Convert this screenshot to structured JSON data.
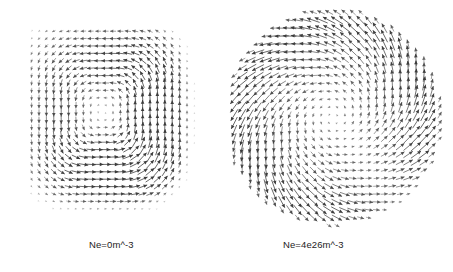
{
  "figure": {
    "background_color": "#ffffff",
    "arrow_color": "#3a3a3a",
    "width": 453,
    "height": 272
  },
  "panels": [
    {
      "id": "panel-left",
      "caption": "Ne=0m^-3",
      "field_type": "closed-recirculation-rounded-square",
      "center_x": 97,
      "center_y": 112
    },
    {
      "id": "panel-right",
      "caption": "Ne=4e26m^-3",
      "field_type": "spiral-vortex",
      "center_x": 338,
      "center_y": 116
    }
  ],
  "chart_data": {
    "type": "scatter",
    "subtype": "quiver",
    "title": "",
    "xlabel": "",
    "ylabel": "",
    "grid": false,
    "legend_position": "none",
    "annotations": [
      "Ne=0m^-3",
      "Ne=4e26m^-3"
    ],
    "series": [
      {
        "name": "Ne=0m^-3",
        "panel": "left",
        "description": "Vector field forming a single closed recirculating cell with rounded-square streamlines; flow circulates clockwise around an off-centre stagnation point located slightly left of and above the panel centre. Arrow magnitude is largest along the right-hand and lower-right boundary of the cell and decays to near zero at the vortex core and outside the cell boundary.",
        "grid_nx": 23,
        "grid_ny": 25,
        "grid_spacing_px": 7.4,
        "domain_shape": "rounded-square",
        "domain_radius_px": 84,
        "core": {
          "x": -10,
          "y": -8
        },
        "rotation": "clockwise",
        "max_arrow_length_px": 9.5,
        "min_arrow_length_px": 0.4,
        "superellipse_exponent": 3.2,
        "strength": 1.0,
        "asymmetry_x": 0.32,
        "asymmetry_y": 0.18
      },
      {
        "name": "Ne=4e26m^-3",
        "panel": "right",
        "description": "Vector field forming a spiral (swirling) pattern on a circular domain; arrows rotate clockwise while also tilting outward, producing pinwheel-like spiral arms. Arrow magnitude grows with radius, reaching a maximum near the outer edge, with a quiet low-magnitude core at the centre and a visible spiral shear seam running from the centre toward the lower-right.",
        "grid_nx": 27,
        "grid_ny": 28,
        "grid_spacing_px": 7.9,
        "domain_shape": "circle",
        "domain_radius_px": 105,
        "core": {
          "x": -4,
          "y": -2
        },
        "rotation": "clockwise",
        "spiral_pitch_deg": 34,
        "max_arrow_length_px": 15.0,
        "min_arrow_length_px": 0.5,
        "strength": 1.0,
        "seam_angle_deg": 55
      }
    ]
  }
}
